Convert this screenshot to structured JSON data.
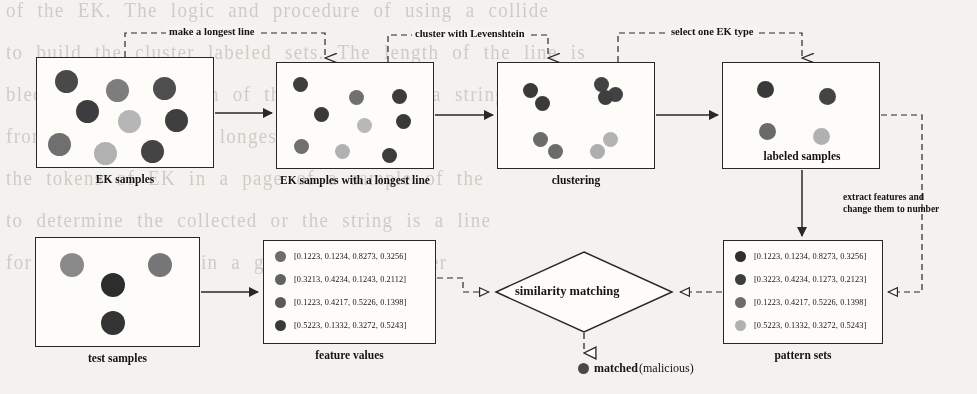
{
  "figure": {
    "colors": {
      "ink": "#2b2a28",
      "paper": "#f4f2ee",
      "box_fill": "#fbfaf7",
      "dot_dark": "#3a3a3a",
      "dot_mid": "#6e6e6e",
      "dot_light": "#a8a8a8",
      "dot_pale": "#c9c9c9"
    }
  },
  "flow_labels": [
    {
      "id": "make-longest-line",
      "text": "make a longest line"
    },
    {
      "id": "cluster-levenshtein",
      "text": "cluster with Levenshtein"
    },
    {
      "id": "select-ek-type",
      "text": "select one EK type"
    }
  ],
  "side_note": {
    "line1": "extract features and",
    "line2": "change them to number"
  },
  "boxes": [
    {
      "id": "ek-samples",
      "caption": "EK samples",
      "caption_inside": false,
      "x": 36,
      "y": 57,
      "w": 178,
      "h": 111,
      "dots": [
        {
          "cx": 29,
          "cy": 23,
          "r": 11.5,
          "shade": "#4a4a4a"
        },
        {
          "cx": 80,
          "cy": 32,
          "r": 11.5,
          "shade": "#7d7d7d"
        },
        {
          "cx": 127,
          "cy": 30,
          "r": 11.5,
          "shade": "#4f4f4f"
        },
        {
          "cx": 50,
          "cy": 53,
          "r": 11.5,
          "shade": "#3e3e3e"
        },
        {
          "cx": 92,
          "cy": 63,
          "r": 11.5,
          "shade": "#b5b5b5"
        },
        {
          "cx": 139,
          "cy": 62,
          "r": 11.5,
          "shade": "#404040"
        },
        {
          "cx": 22,
          "cy": 86,
          "r": 11.5,
          "shade": "#6f6f6f"
        },
        {
          "cx": 68,
          "cy": 95,
          "r": 11.5,
          "shade": "#b0b0b0"
        },
        {
          "cx": 115,
          "cy": 93,
          "r": 11.5,
          "shade": "#454545"
        }
      ]
    },
    {
      "id": "ek-samples-longest-line",
      "caption": "EK samples with a longest line",
      "caption_inside": false,
      "x": 276,
      "y": 62,
      "w": 158,
      "h": 107,
      "dots": [
        {
          "cx": 23,
          "cy": 21,
          "r": 7.5,
          "shade": "#3f3f3f"
        },
        {
          "cx": 79,
          "cy": 34,
          "r": 7.5,
          "shade": "#707070"
        },
        {
          "cx": 122,
          "cy": 33,
          "r": 7.5,
          "shade": "#3d3d3d"
        },
        {
          "cx": 44,
          "cy": 51,
          "r": 7.5,
          "shade": "#3b3b3b"
        },
        {
          "cx": 87,
          "cy": 62,
          "r": 7.5,
          "shade": "#b7b7b7"
        },
        {
          "cx": 126,
          "cy": 58,
          "r": 7.5,
          "shade": "#3a3a3a"
        },
        {
          "cx": 24,
          "cy": 83,
          "r": 7.5,
          "shade": "#707070"
        },
        {
          "cx": 65,
          "cy": 88,
          "r": 7.5,
          "shade": "#b0b0b0"
        },
        {
          "cx": 112,
          "cy": 92,
          "r": 7.5,
          "shade": "#3d3d3d"
        }
      ]
    },
    {
      "id": "clustering",
      "caption": "clustering",
      "caption_inside": false,
      "x": 497,
      "y": 62,
      "w": 158,
      "h": 107,
      "dots": [
        {
          "cx": 32,
          "cy": 27,
          "r": 7.5,
          "shade": "#3b3b3b"
        },
        {
          "cx": 44,
          "cy": 40,
          "r": 7.5,
          "shade": "#3b3b3b"
        },
        {
          "cx": 103,
          "cy": 21,
          "r": 7.5,
          "shade": "#434343"
        },
        {
          "cx": 117,
          "cy": 31,
          "r": 7.5,
          "shade": "#434343"
        },
        {
          "cx": 107,
          "cy": 34,
          "r": 7.5,
          "shade": "#3f3f3f"
        },
        {
          "cx": 42,
          "cy": 76,
          "r": 7.5,
          "shade": "#6c6c6c"
        },
        {
          "cx": 57,
          "cy": 88,
          "r": 7.5,
          "shade": "#6c6c6c"
        },
        {
          "cx": 112,
          "cy": 76,
          "r": 7.5,
          "shade": "#b2b2b2"
        },
        {
          "cx": 99,
          "cy": 88,
          "r": 7.5,
          "shade": "#adadad"
        }
      ]
    },
    {
      "id": "labeled-samples",
      "caption": "labeled samples",
      "caption_inside": true,
      "x": 722,
      "y": 62,
      "w": 158,
      "h": 107,
      "dots": [
        {
          "cx": 42,
          "cy": 26,
          "r": 8.5,
          "shade": "#3a3a3a"
        },
        {
          "cx": 104,
          "cy": 33,
          "r": 8.5,
          "shade": "#454545"
        },
        {
          "cx": 44,
          "cy": 68,
          "r": 8.5,
          "shade": "#6a6a6a"
        },
        {
          "cx": 98,
          "cy": 73,
          "r": 8.5,
          "shade": "#b0b0b0"
        }
      ]
    },
    {
      "id": "test-samples",
      "caption": "test samples",
      "caption_inside": false,
      "x": 35,
      "y": 237,
      "w": 165,
      "h": 110,
      "dots": [
        {
          "cx": 36,
          "cy": 27,
          "r": 12,
          "shade": "#8a8a8a"
        },
        {
          "cx": 124,
          "cy": 27,
          "r": 12,
          "shade": "#777777"
        },
        {
          "cx": 77,
          "cy": 47,
          "r": 12,
          "shade": "#2f2f2f"
        },
        {
          "cx": 77,
          "cy": 85,
          "r": 12,
          "shade": "#353535"
        }
      ]
    }
  ],
  "feature_values": {
    "id": "feature-values",
    "caption": "feature values",
    "x": 263,
    "y": 240,
    "w": 173,
    "h": 104,
    "rows": [
      {
        "shade": "#6d6d6d",
        "text": "[0.1223, 0.1234, 0.8273, 0.3256]"
      },
      {
        "shade": "#636363",
        "text": "[0.3213, 0.4234, 0.1243, 0.2112]"
      },
      {
        "shade": "#5a5a5a",
        "text": "[0.1223, 0.4217, 0.5226, 0.1398]"
      },
      {
        "shade": "#3a3a3a",
        "text": "[0.5223, 0.1332, 0.3272, 0.5243]"
      }
    ]
  },
  "pattern_sets": {
    "id": "pattern-sets",
    "caption": "pattern sets",
    "x": 723,
    "y": 240,
    "w": 160,
    "h": 104,
    "rows": [
      {
        "shade": "#303030",
        "text": "[0.1223, 0.1234, 0.8273, 0.3256]"
      },
      {
        "shade": "#3f3f3f",
        "text": "[0.3223, 0.4234, 0.1273, 0.2123]"
      },
      {
        "shade": "#6c6c6c",
        "text": "[0.1223, 0.4217, 0.5226, 0.1398]"
      },
      {
        "shade": "#b0b0b0",
        "text": "[0.5223, 0.1332, 0.3272, 0.5243]"
      }
    ]
  },
  "decision": {
    "id": "similarity-matching",
    "label": "similarity matching"
  },
  "result": {
    "id": "matched-result",
    "strong": "matched",
    "normal": "(malicious)"
  },
  "background_text": [
    "of the EK. The logic and procedure of using a collide",
    "to build the cluster labeled sets. The length of the line is",
    "",
    "bled by the collection of the samples and a string",
    "from the string of a longest line.",
    "",
    "the tokens of EK  in a  page  of  a  sample  of  the",
    "",
    "to determine  the  collected  or the  string is  a  line",
    "for the EK  sample  in  a  given  of  the  cluster"
  ]
}
